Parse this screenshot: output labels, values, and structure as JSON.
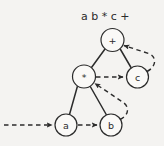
{
  "figure": {
    "caption": "a b * c +",
    "background_color": "#f4f3f1",
    "ink_color": "#2b2b2b",
    "nodes": [
      {
        "id": "plus",
        "label": "+",
        "cx": 112.5,
        "cy": 40,
        "r": 11.5,
        "kind": "operator"
      },
      {
        "id": "times",
        "label": "*",
        "cx": 84,
        "cy": 76.5,
        "r": 11.5,
        "kind": "operator"
      },
      {
        "id": "c",
        "label": "c",
        "cx": 137.5,
        "cy": 77,
        "r": 11,
        "kind": "operand"
      },
      {
        "id": "a",
        "label": "a",
        "cx": 66,
        "cy": 125,
        "r": 11,
        "kind": "operand"
      },
      {
        "id": "b",
        "label": "b",
        "cx": 111,
        "cy": 125,
        "r": 11,
        "kind": "operand"
      }
    ],
    "tree_edges": [
      {
        "from": "plus",
        "to": "times",
        "style": "solid"
      },
      {
        "from": "plus",
        "to": "c",
        "style": "solid"
      },
      {
        "from": "times",
        "to": "a",
        "style": "solid"
      },
      {
        "from": "times",
        "to": "b",
        "style": "solid"
      }
    ],
    "flow_edges": [
      {
        "id": "entry-to-a",
        "from": "start",
        "to": "a",
        "style": "dashed",
        "shape": "straight"
      },
      {
        "id": "a-to-b",
        "from": "a",
        "to": "b",
        "style": "dashed",
        "shape": "straight"
      },
      {
        "id": "b-to-times",
        "from": "b",
        "to": "times",
        "style": "dashed",
        "shape": "curved"
      },
      {
        "id": "times-to-c",
        "from": "times",
        "to": "c",
        "style": "dashed",
        "shape": "straight"
      },
      {
        "id": "c-to-plus",
        "from": "c",
        "to": "plus",
        "style": "dashed",
        "shape": "curved"
      }
    ]
  }
}
